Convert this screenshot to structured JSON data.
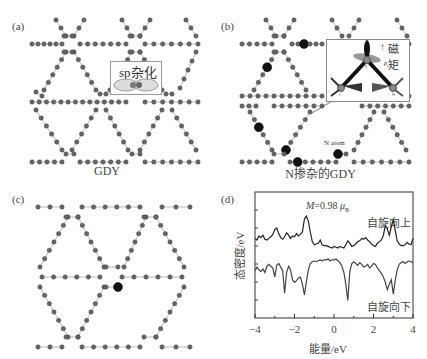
{
  "panels": {
    "a": {
      "label": "(a)",
      "caption": "GDY",
      "inset_label": "sp杂化"
    },
    "b": {
      "label": "(b)",
      "caption": "N掺杂的GDY",
      "inset_label": "磁矩",
      "inset_arrow": "↑",
      "inset_atom_labels": [
        "C",
        "C",
        "N"
      ],
      "orbital_label": "pz",
      "annotation": "N atom"
    },
    "c": {
      "label": "(c)"
    },
    "d": {
      "label": "(d)"
    }
  },
  "chart_data": {
    "type": "line",
    "title": "",
    "annotation": "M=0.98 μB",
    "annotation_M": "M",
    "annotation_value": "=0.98 ",
    "annotation_unit": "μ",
    "annotation_sub": "B",
    "xlabel": "能量/eV",
    "ylabel": "态密度/eV",
    "xlim": [
      -4,
      4
    ],
    "xticks": [
      -4,
      -2,
      0,
      2,
      4
    ],
    "xtick_labels": [
      "−4",
      "−2",
      "0",
      "2",
      "4"
    ],
    "grid": false,
    "legend": "none",
    "series": [
      {
        "name": "自旋向上",
        "x": [
          -4.0,
          -3.9,
          -3.8,
          -3.7,
          -3.6,
          -3.5,
          -3.4,
          -3.3,
          -3.2,
          -3.1,
          -3.0,
          -2.9,
          -2.8,
          -2.7,
          -2.6,
          -2.5,
          -2.4,
          -2.3,
          -2.2,
          -2.1,
          -2.0,
          -1.9,
          -1.8,
          -1.7,
          -1.6,
          -1.5,
          -1.4,
          -1.3,
          -1.2,
          -1.1,
          -1.0,
          -0.9,
          -0.8,
          -0.7,
          -0.6,
          -0.5,
          -0.4,
          -0.3,
          -0.2,
          -0.1,
          0.0,
          0.1,
          0.2,
          0.3,
          0.4,
          0.5,
          0.6,
          0.7,
          0.8,
          0.9,
          1.0,
          1.1,
          1.2,
          1.3,
          1.4,
          1.5,
          1.6,
          1.7,
          1.8,
          1.9,
          2.0,
          2.1,
          2.2,
          2.3,
          2.4,
          2.5,
          2.6,
          2.7,
          2.8,
          2.9,
          3.0,
          3.1,
          3.2,
          3.3,
          3.4,
          3.5,
          3.6,
          3.7,
          3.8,
          3.9,
          4.0
        ],
        "y": [
          1.2,
          1.0,
          1.5,
          1.3,
          1.6,
          1.1,
          1.0,
          1.2,
          1.4,
          1.7,
          2.3,
          2.5,
          1.8,
          1.3,
          1.1,
          1.4,
          1.9,
          1.6,
          1.2,
          1.5,
          1.4,
          1.8,
          1.5,
          1.7,
          2.0,
          3.6,
          4.0,
          3.4,
          2.0,
          0.8,
          0.4,
          0.5,
          0.6,
          1.0,
          0.4,
          0.3,
          0.3,
          0.2,
          0.1,
          0.0,
          0.2,
          0.1,
          0.0,
          0.2,
          0.1,
          0.0,
          0.4,
          0.9,
          0.6,
          0.2,
          0.3,
          0.5,
          0.8,
          0.9,
          1.2,
          1.1,
          1.3,
          1.0,
          0.8,
          0.5,
          0.3,
          0.2,
          0.6,
          0.8,
          1.0,
          1.6,
          2.8,
          2.4,
          1.6,
          2.6,
          3.6,
          2.2,
          0.9,
          0.5,
          0.3,
          0.3,
          0.4,
          0.7,
          0.5,
          0.4,
          1.2
        ]
      },
      {
        "name": "自旋向下",
        "x": [
          -4.0,
          -3.9,
          -3.8,
          -3.7,
          -3.6,
          -3.5,
          -3.4,
          -3.3,
          -3.2,
          -3.1,
          -3.0,
          -2.9,
          -2.8,
          -2.7,
          -2.6,
          -2.5,
          -2.4,
          -2.3,
          -2.2,
          -2.1,
          -2.0,
          -1.9,
          -1.8,
          -1.7,
          -1.6,
          -1.5,
          -1.4,
          -1.3,
          -1.2,
          -1.1,
          -1.0,
          -0.9,
          -0.8,
          -0.7,
          -0.6,
          -0.5,
          -0.4,
          -0.3,
          -0.2,
          -0.1,
          0.0,
          0.1,
          0.2,
          0.3,
          0.4,
          0.5,
          0.6,
          0.7,
          0.8,
          0.9,
          1.0,
          1.1,
          1.2,
          1.3,
          1.4,
          1.5,
          1.6,
          1.7,
          1.8,
          1.9,
          2.0,
          2.1,
          2.2,
          2.3,
          2.4,
          2.5,
          2.6,
          2.7,
          2.8,
          2.9,
          3.0,
          3.1,
          3.2,
          3.3,
          3.4,
          3.5,
          3.6,
          3.7,
          3.8,
          3.9,
          4.0
        ],
        "y": [
          -1.3,
          -0.9,
          -1.2,
          -1.4,
          -1.1,
          -1.5,
          -0.8,
          -0.6,
          -0.8,
          -1.0,
          -2.0,
          -0.7,
          -0.5,
          -0.9,
          -1.3,
          -3.8,
          -1.5,
          -0.8,
          -1.2,
          -2.3,
          -2.6,
          -2.4,
          -2.1,
          -2.0,
          -2.8,
          -4.0,
          -2.6,
          -1.2,
          -0.5,
          -0.3,
          -0.2,
          -0.3,
          -0.2,
          -0.1,
          -0.2,
          -0.1,
          -0.1,
          0.0,
          -0.2,
          -0.1,
          -0.1,
          0.0,
          -0.2,
          -0.4,
          -0.8,
          -1.5,
          -2.8,
          -4.6,
          -1.4,
          -0.5,
          -0.3,
          -0.5,
          -0.7,
          -0.4,
          -0.6,
          -0.9,
          -0.8,
          -0.6,
          -1.0,
          -0.8,
          -0.5,
          -0.6,
          -1.0,
          -1.3,
          -1.6,
          -2.0,
          -2.6,
          -3.4,
          -2.8,
          -2.3,
          -3.9,
          -2.4,
          -1.2,
          -0.6,
          -0.4,
          -0.3,
          -0.5,
          -0.3,
          -0.2,
          -0.3,
          -0.4
        ]
      }
    ],
    "series_labels": [
      "自旋向上",
      "自旋向下"
    ]
  }
}
